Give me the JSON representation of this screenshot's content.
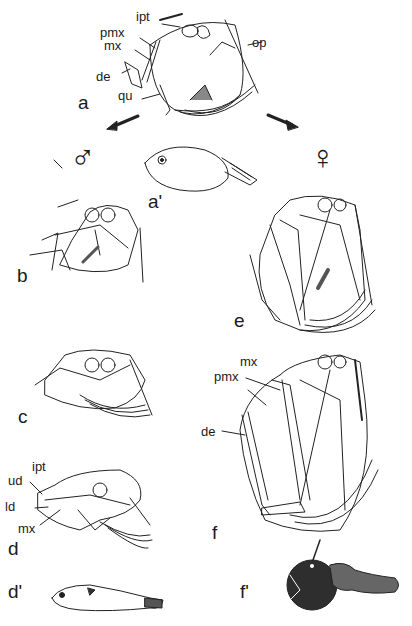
{
  "figure": {
    "sex_symbols": {
      "male": "♂",
      "female": "♀"
    },
    "panels": {
      "a": "a",
      "a_prime": "a'",
      "b": "b",
      "c": "c",
      "d": "d",
      "d_prime": "d'",
      "e": "e",
      "f": "f",
      "f_prime": "f'"
    },
    "labels_a": {
      "ipt": "ipt",
      "pmx": "pmx",
      "mx": "mx",
      "de": "de",
      "qu": "qu",
      "op": "op"
    },
    "labels_d": {
      "ipt": "ipt",
      "ud": "ud",
      "ld": "ld",
      "mx": "mx"
    },
    "labels_f": {
      "mx": "mx",
      "pmx": "pmx",
      "de": "de"
    }
  }
}
